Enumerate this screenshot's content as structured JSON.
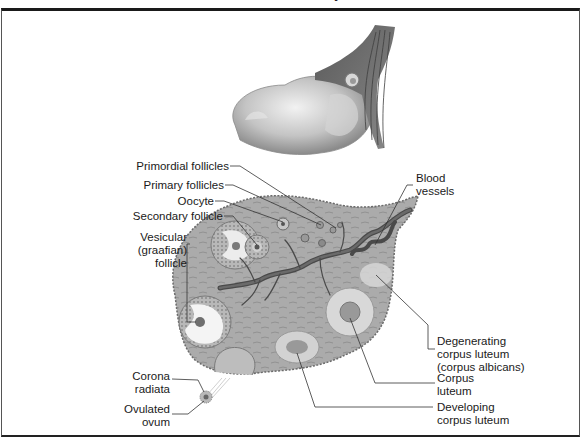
{
  "figure": {
    "title_cut": "Ovarian Anatomy",
    "labels": {
      "primordial_follicles": "Primordial follicles",
      "primary_follicles": "Primary follicles",
      "oocyte": "Oocyte",
      "secondary_follicle": "Secondary follicle",
      "vesicular_1": "Vesicular",
      "vesicular_2": "(graafian)",
      "vesicular_3": "follicle",
      "blood_1": "Blood",
      "blood_2": "vessels",
      "degen_1": "Degenerating",
      "degen_2": "corpus luteum",
      "degen_3": "(corpus albicans)",
      "cl_1": "Corpus",
      "cl_2": "luteum",
      "dev_1": "Developing",
      "dev_2": "corpus luteum",
      "corona_1": "Corona",
      "corona_2": "radiata",
      "ovum_1": "Ovulated",
      "ovum_2": "ovum"
    },
    "colors": {
      "tissue": "#a8a8a8",
      "tissue_dark": "#7a7a7a",
      "vessel": "#555555",
      "light": "#e0e0e0",
      "border": "#1a1a1a"
    }
  }
}
